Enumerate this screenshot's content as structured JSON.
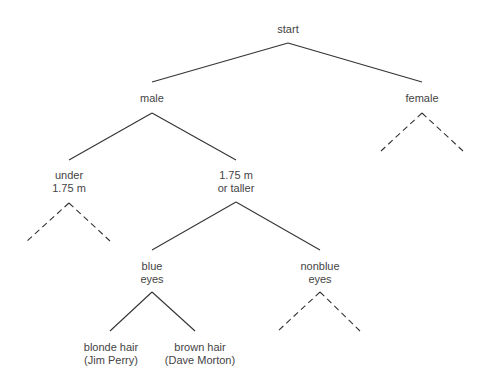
{
  "diagram": {
    "type": "decision-tree",
    "nodes": [
      {
        "id": "start",
        "lines": [
          "start"
        ],
        "x": 288,
        "y": 23
      },
      {
        "id": "male",
        "lines": [
          "male"
        ],
        "x": 152,
        "y": 92
      },
      {
        "id": "female",
        "lines": [
          "female"
        ],
        "x": 422,
        "y": 92
      },
      {
        "id": "under",
        "lines": [
          "under",
          "1.75 m"
        ],
        "x": 69,
        "y": 169
      },
      {
        "id": "taller",
        "lines": [
          "1.75 m",
          "or taller"
        ],
        "x": 236,
        "y": 169
      },
      {
        "id": "blue",
        "lines": [
          "blue",
          "eyes"
        ],
        "x": 152,
        "y": 260
      },
      {
        "id": "nonblue",
        "lines": [
          "nonblue",
          "eyes"
        ],
        "x": 320,
        "y": 260
      },
      {
        "id": "blonde",
        "lines": [
          "blonde hair",
          "(Jim Perry)"
        ],
        "x": 111,
        "y": 341
      },
      {
        "id": "brown",
        "lines": [
          "brown hair",
          "(Dave Morton)"
        ],
        "x": 200,
        "y": 341
      }
    ],
    "edges": [
      {
        "from": "start",
        "to": "male",
        "style": "solid"
      },
      {
        "from": "start",
        "to": "female",
        "style": "solid"
      },
      {
        "from": "male",
        "to": "under",
        "style": "solid"
      },
      {
        "from": "male",
        "to": "taller",
        "style": "solid"
      },
      {
        "from": "female",
        "to": null,
        "style": "dashed"
      },
      {
        "from": "female",
        "to": null,
        "style": "dashed"
      },
      {
        "from": "under",
        "to": null,
        "style": "dashed"
      },
      {
        "from": "under",
        "to": null,
        "style": "dashed"
      },
      {
        "from": "taller",
        "to": "blue",
        "style": "solid"
      },
      {
        "from": "taller",
        "to": "nonblue",
        "style": "solid"
      },
      {
        "from": "blue",
        "to": "blonde",
        "style": "solid"
      },
      {
        "from": "blue",
        "to": "brown",
        "style": "solid"
      },
      {
        "from": "nonblue",
        "to": null,
        "style": "dashed"
      },
      {
        "from": "nonblue",
        "to": null,
        "style": "dashed"
      }
    ],
    "colors": {
      "line": "#333333",
      "text": "#444444",
      "background": "#ffffff"
    }
  }
}
